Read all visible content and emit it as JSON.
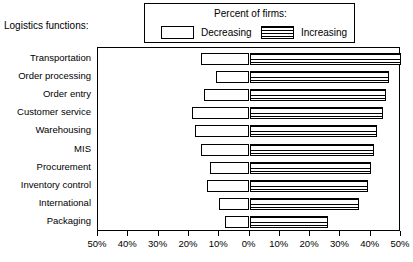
{
  "axis_title": "Logistics functions:",
  "legend": {
    "title": "Percent of firms:",
    "entries": [
      {
        "label": "Decreasing",
        "swatch": "white-box-swatch"
      },
      {
        "label": "Increasing",
        "swatch": "striped-box-swatch"
      }
    ]
  },
  "chart_data": {
    "type": "bar",
    "orientation": "horizontal",
    "layout": "diverging-bidirectional",
    "title": "Percent of firms:",
    "xlabel": "",
    "ylabel": "Logistics functions:",
    "xlim": [
      -50,
      50
    ],
    "xticks": [
      -50,
      -40,
      -30,
      -20,
      -10,
      0,
      10,
      20,
      30,
      40,
      50
    ],
    "xticklabels": [
      "50%",
      "40%",
      "30%",
      "20%",
      "10%",
      "0%",
      "10%",
      "20%",
      "30%",
      "40%",
      "50%"
    ],
    "grid": false,
    "legend_position": "top",
    "categories": [
      "Transportation",
      "Order processing",
      "Order entry",
      "Customer service",
      "Warehousing",
      "MIS",
      "Procurement",
      "Inventory control",
      "International",
      "Packaging"
    ],
    "series": [
      {
        "name": "Decreasing",
        "direction": "left",
        "values": [
          16,
          11,
          15,
          19,
          18,
          16,
          13,
          14,
          10,
          8
        ]
      },
      {
        "name": "Increasing",
        "direction": "right",
        "values": [
          50,
          46,
          45,
          44,
          42,
          41,
          40,
          39,
          36,
          26
        ]
      }
    ]
  }
}
